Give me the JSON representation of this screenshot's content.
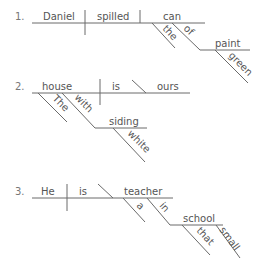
{
  "diagrams": [
    {
      "number": "1.",
      "subject": "Daniel",
      "verb": "spilled",
      "object": "can",
      "modifiers": {
        "can_article": "the",
        "can_prep": "of",
        "prep_object": "paint",
        "paint_adj": "green"
      }
    },
    {
      "number": "2.",
      "subject": "house",
      "verb": "is",
      "complement": "ours",
      "modifiers": {
        "house_article": "The",
        "house_prep": "with",
        "prep_object": "siding",
        "siding_adj": "white"
      }
    },
    {
      "number": "3.",
      "subject": "He",
      "verb": "is",
      "complement": "teacher",
      "modifiers": {
        "teacher_article": "a",
        "teacher_prep": "in",
        "prep_object": "school",
        "school_det": "that",
        "school_adj": "small"
      }
    }
  ]
}
